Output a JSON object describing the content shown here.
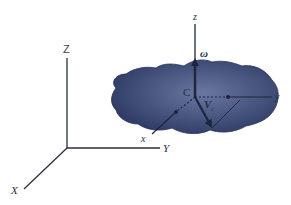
{
  "figure": {
    "type": "rigid-body-kinematics-diagram",
    "colors": {
      "background": "#ffffff",
      "body": "#3a4770",
      "body_highlight": "#6a77a0",
      "axis": "#2a2f45",
      "text": "#2a2f45"
    },
    "global_axes": {
      "origin": [
        67,
        148
      ],
      "Z_label": "Z",
      "Y_label": "Y",
      "X_label": "X"
    },
    "local_axes": {
      "origin_label": "C",
      "z_label": "z",
      "y_label": "y",
      "x_label": "x"
    },
    "vectors": {
      "angular_velocity_label": "ω",
      "velocity_label": "V",
      "velocity_subscript": "c"
    }
  }
}
